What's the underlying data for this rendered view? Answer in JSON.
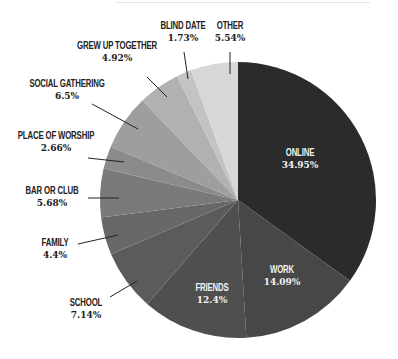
{
  "chart_data": {
    "type": "pie",
    "title": "",
    "start_angle_deg": 0,
    "direction": "clockwise",
    "slices": [
      {
        "label": "ONLINE",
        "value": 34.95,
        "pct_text": "34.95%",
        "color": "#2b2b2b",
        "label_pos": "inside"
      },
      {
        "label": "WORK",
        "value": 14.09,
        "pct_text": "14.09%",
        "color": "#474747",
        "label_pos": "inside"
      },
      {
        "label": "FRIENDS",
        "value": 12.4,
        "pct_text": "12.4%",
        "color": "#4f4f4f",
        "label_pos": "inside"
      },
      {
        "label": "SCHOOL",
        "value": 7.14,
        "pct_text": "7.14%",
        "color": "#5b5b5b",
        "label_pos": "outside"
      },
      {
        "label": "FAMILY",
        "value": 4.4,
        "pct_text": "4.4%",
        "color": "#686868",
        "label_pos": "outside"
      },
      {
        "label": "BAR OR CLUB",
        "value": 5.68,
        "pct_text": "5.68%",
        "color": "#7a7a7a",
        "label_pos": "outside"
      },
      {
        "label": "PLACE OF WORSHIP",
        "value": 2.66,
        "pct_text": "2.66%",
        "color": "#8b8b8b",
        "label_pos": "outside"
      },
      {
        "label": "SOCIAL GATHERING",
        "value": 6.5,
        "pct_text": "6.5%",
        "color": "#9e9e9e",
        "label_pos": "outside"
      },
      {
        "label": "GREW UP TOGETHER",
        "value": 4.92,
        "pct_text": "4.92%",
        "color": "#b1b1b1",
        "label_pos": "outside"
      },
      {
        "label": "BLIND DATE",
        "value": 1.73,
        "pct_text": "1.73%",
        "color": "#c3c3c3",
        "label_pos": "outside"
      },
      {
        "label": "OTHER",
        "value": 5.54,
        "pct_text": "5.54%",
        "color": "#d7d7d7",
        "label_pos": "outside"
      }
    ],
    "legend": "none",
    "label_color_inside": "#f2f2f2",
    "label_color_outside": "#222222"
  }
}
